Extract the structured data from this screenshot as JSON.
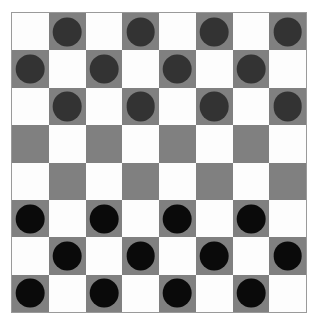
{
  "board": {
    "name": "checkers-board",
    "rows": 8,
    "columns": 8,
    "light_square_color": "#fdfdfd",
    "dark_square_color": "#808080",
    "border_color": "#9a9a9a",
    "background_color": "#ffffff",
    "dark_square_parity": "dark squares are where (row + col) is odd, 0-indexed",
    "squares": [
      [
        "light",
        "dark",
        "light",
        "dark",
        "light",
        "dark",
        "light",
        "dark"
      ],
      [
        "dark",
        "light",
        "dark",
        "light",
        "dark",
        "light",
        "dark",
        "light"
      ],
      [
        "light",
        "dark",
        "light",
        "dark",
        "light",
        "dark",
        "light",
        "dark"
      ],
      [
        "dark",
        "light",
        "dark",
        "light",
        "dark",
        "light",
        "dark",
        "light"
      ],
      [
        "light",
        "dark",
        "light",
        "dark",
        "light",
        "dark",
        "light",
        "dark"
      ],
      [
        "dark",
        "light",
        "dark",
        "light",
        "dark",
        "light",
        "dark",
        "light"
      ],
      [
        "light",
        "dark",
        "light",
        "dark",
        "light",
        "dark",
        "light",
        "dark"
      ],
      [
        "dark",
        "light",
        "dark",
        "light",
        "dark",
        "light",
        "dark",
        "light"
      ]
    ]
  },
  "pieces": {
    "red_color": "#333333",
    "black_color": "#0a0a0a",
    "red_label": "dark-gray-piece",
    "black_label": "black-piece",
    "red_count": 12,
    "black_count": 12,
    "grid": [
      [
        "",
        "red",
        "",
        "red",
        "",
        "red",
        "",
        "red"
      ],
      [
        "red",
        "",
        "red",
        "",
        "red",
        "",
        "red",
        ""
      ],
      [
        "",
        "red",
        "",
        "red",
        "",
        "red",
        "",
        "red"
      ],
      [
        "",
        "",
        "",
        "",
        "",
        "",
        "",
        ""
      ],
      [
        "",
        "",
        "",
        "",
        "",
        "",
        "",
        ""
      ],
      [
        "black",
        "",
        "black",
        "",
        "black",
        "",
        "black",
        ""
      ],
      [
        "",
        "black",
        "",
        "black",
        "",
        "black",
        "",
        "black"
      ],
      [
        "black",
        "",
        "black",
        "",
        "black",
        "",
        "black",
        ""
      ]
    ]
  }
}
